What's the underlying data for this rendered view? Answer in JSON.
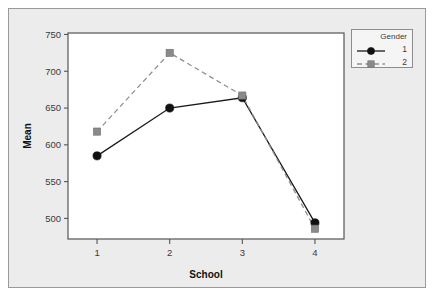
{
  "chart_data": {
    "type": "line",
    "title": "",
    "subtitle": "",
    "xlabel": "School",
    "ylabel": "Mean",
    "categories": [
      "1",
      "2",
      "3",
      "4"
    ],
    "x": [
      1,
      2,
      3,
      4
    ],
    "xlim": [
      0.6,
      4.4
    ],
    "ylim": [
      472,
      752
    ],
    "yticks": [
      500,
      550,
      600,
      650,
      700,
      750
    ],
    "ytick_labels": [
      "500",
      "550",
      "600",
      "650",
      "700",
      "750"
    ],
    "xticks": [
      1,
      2,
      3,
      4
    ],
    "xtick_labels": [
      "1",
      "2",
      "3",
      "4"
    ],
    "grid": false,
    "legend_position": "top-right-outside",
    "legend_title": "Gender",
    "series": [
      {
        "name": "1",
        "values": [
          585,
          650,
          664,
          494
        ],
        "color": "#111111",
        "marker": "circle",
        "linestyle": "solid"
      },
      {
        "name": "2",
        "values": [
          618,
          725,
          667,
          486
        ],
        "color": "#8a8a8a",
        "marker": "square",
        "linestyle": "dashed"
      }
    ]
  },
  "legend": {
    "title": "Gender",
    "entries": [
      {
        "label": "1"
      },
      {
        "label": "2"
      }
    ]
  },
  "axes": {
    "y_title": "Mean",
    "x_title": "School"
  },
  "colors": {
    "panel_background": "#ececec",
    "plot_background": "#ffffff",
    "axis": "#555555",
    "series1": "#111111",
    "series2": "#8a8a8a",
    "border": "#9a9a9a"
  }
}
